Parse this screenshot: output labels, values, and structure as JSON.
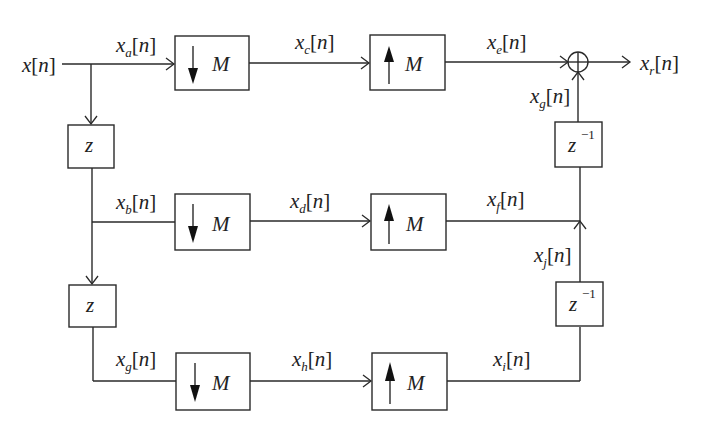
{
  "diagram": {
    "type": "polyphase decimation/interpolation filter bank",
    "input": {
      "label": "x",
      "arg": "n"
    },
    "output": {
      "label": "x",
      "sub": "r",
      "arg": "n"
    },
    "branches": [
      {
        "id": "top",
        "in_signal": {
          "label": "x",
          "sub": "a",
          "arg": "n"
        },
        "down_block": {
          "symbol": "M",
          "direction": "down"
        },
        "mid_signal": {
          "label": "x",
          "sub": "c",
          "arg": "n"
        },
        "up_block": {
          "symbol": "M",
          "direction": "up"
        },
        "out_signal": {
          "label": "x",
          "sub": "e",
          "arg": "n"
        }
      },
      {
        "id": "middle",
        "in_signal": {
          "label": "x",
          "sub": "b",
          "arg": "n"
        },
        "down_block": {
          "symbol": "M",
          "direction": "down"
        },
        "mid_signal": {
          "label": "x",
          "sub": "d",
          "arg": "n"
        },
        "up_block": {
          "symbol": "M",
          "direction": "up"
        },
        "out_signal": {
          "label": "x",
          "sub": "f",
          "arg": "n"
        }
      },
      {
        "id": "bottom",
        "in_signal": {
          "label": "x",
          "sub": "g",
          "arg": "n"
        },
        "down_block": {
          "symbol": "M",
          "direction": "down"
        },
        "mid_signal": {
          "label": "x",
          "sub": "h",
          "arg": "n"
        },
        "up_block": {
          "symbol": "M",
          "direction": "up"
        },
        "out_signal": {
          "label": "x",
          "sub": "i",
          "arg": "n"
        }
      }
    ],
    "delay_blocks_left": [
      {
        "label": "z"
      },
      {
        "label": "z"
      }
    ],
    "delay_blocks_right": [
      {
        "label": "z",
        "exp": "−1"
      },
      {
        "label": "z",
        "exp": "−1"
      }
    ],
    "right_signals": [
      {
        "label": "x",
        "sub": "g",
        "arg": "n"
      },
      {
        "label": "x",
        "sub": "j",
        "arg": "n"
      }
    ],
    "summer": {
      "symbol": "+"
    },
    "colors": {
      "line": "#2a2a2a",
      "background": "#ffffff"
    }
  }
}
